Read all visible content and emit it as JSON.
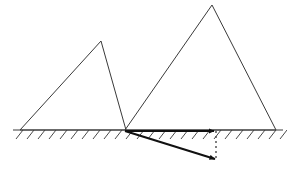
{
  "canvas": {
    "width": 287,
    "height": 176,
    "background": "#ffffff"
  },
  "style": {
    "outline_color": "#3a3a3a",
    "outline_width": 1,
    "ground_color": "#3a3a3a",
    "ground_width": 1.2,
    "hatch_color": "#4a4a4a",
    "hatch_width": 1,
    "arrow_color": "#111111",
    "arrow_width": 2.2,
    "dashed_color": "#4a4a4a",
    "dashed_width": 1.4,
    "dash_pattern": "2,3"
  },
  "ground": {
    "label": "ground-surface",
    "x1": 13,
    "y1": 130,
    "x2": 283,
    "y2": 130,
    "hatch": {
      "count": 25,
      "start_x": 16,
      "spacing": 11,
      "dx": 7,
      "dy": 9
    }
  },
  "shapes": [
    {
      "name": "left-triangle",
      "points": "20,130 101,41 126,130",
      "apex": {
        "x": 101,
        "y": 41
      },
      "base_left": {
        "x": 20,
        "y": 130
      },
      "base_right": {
        "x": 126,
        "y": 130
      }
    },
    {
      "name": "right-triangle",
      "points": "125,130 212,5 276,130",
      "apex": {
        "x": 212,
        "y": 5
      },
      "base_left": {
        "x": 125,
        "y": 130
      },
      "base_right": {
        "x": 276,
        "y": 130
      }
    }
  ],
  "vectors": [
    {
      "name": "horizontal-arrow",
      "x1": 125,
      "y1": 131,
      "x2": 214,
      "y2": 131,
      "arrowhead": true
    },
    {
      "name": "diagonal-arrow",
      "x1": 125,
      "y1": 131,
      "x2": 215,
      "y2": 159,
      "arrowhead": true
    }
  ],
  "guides": [
    {
      "name": "vertical-dashed-guide",
      "x1": 216,
      "y1": 131,
      "x2": 216,
      "y2": 160
    }
  ]
}
